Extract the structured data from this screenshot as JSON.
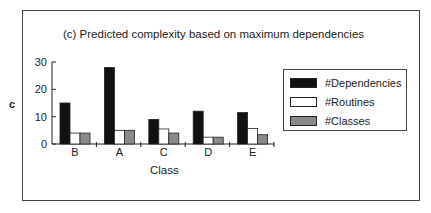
{
  "chart_data": {
    "type": "bar",
    "title": "(c) Predicted complexity based on maximum dependencies",
    "xlabel": "Class",
    "ylabel": "c",
    "categories": [
      "B",
      "A",
      "C",
      "D",
      "E"
    ],
    "series": [
      {
        "name": "#Dependencies",
        "color": "#111111",
        "values": [
          15,
          28,
          9,
          12,
          11.5
        ]
      },
      {
        "name": "#Routines",
        "color": "#ffffff",
        "values": [
          4,
          5,
          5.5,
          2.5,
          5.7
        ]
      },
      {
        "name": "#Classes",
        "color": "#8a8a8a",
        "values": [
          4,
          5,
          4,
          2.5,
          3.4
        ]
      }
    ],
    "yticks": [
      0,
      10,
      20,
      30
    ],
    "ylim": [
      0,
      30
    ],
    "grid": false,
    "legend_position": "right"
  }
}
